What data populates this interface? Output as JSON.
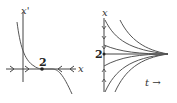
{
  "diagram": {
    "left_panel": {
      "title": "phase line",
      "y_axis_label": "x'",
      "x_axis_label": "x",
      "equilibrium_label": "2",
      "flow_direction": "toward equilibrium from both sides (semi-stable/stable at 2)"
    },
    "right_panel": {
      "title": "solution curves",
      "y_axis_label": "x",
      "time_label": "t →",
      "equilibrium_label": "2"
    },
    "colors": {
      "curve": "#555555",
      "axis": "#444444",
      "text": "#333333"
    }
  }
}
